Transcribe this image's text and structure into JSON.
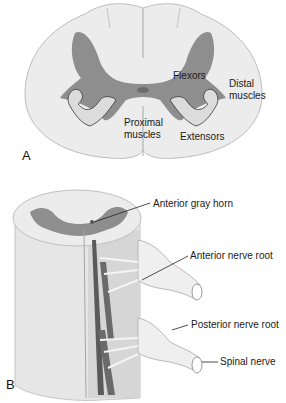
{
  "figure": {
    "panel_a": {
      "letter": "A",
      "labels": {
        "flexors": "Flexors",
        "distal_1": "Distal",
        "distal_2": "muscles",
        "proximal_1": "Proximal",
        "proximal_2": "muscles",
        "extensors": "Extensors"
      }
    },
    "panel_b": {
      "letter": "B",
      "labels": {
        "anterior_gray_horn": "Anterior gray horn",
        "anterior_nerve_root": "Anterior nerve root",
        "posterior_nerve_root": "Posterior nerve root",
        "spinal_nerve": "Spinal nerve"
      }
    },
    "colors": {
      "white_matter": "#ececec",
      "gray_matter": "#8e8e8e",
      "outline": "#b5b5b5",
      "arm": "#dcdcdc",
      "cord_shade": "#cfcfcf",
      "dark_tract": "#5a5a5a"
    }
  }
}
